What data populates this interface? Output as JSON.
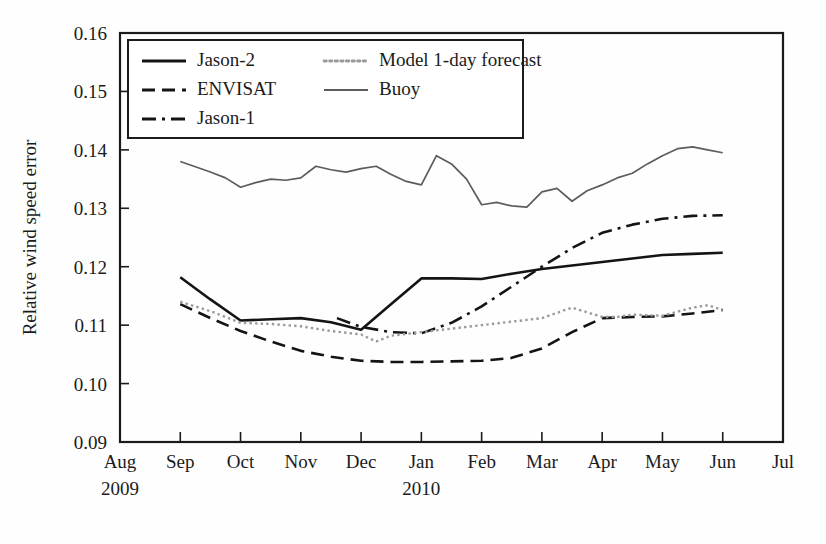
{
  "chart_data": {
    "type": "line",
    "title": "",
    "xlabel": "",
    "ylabel": "Relative wind speed error",
    "ylim": [
      0.09,
      0.16
    ],
    "yticks": [
      "0.09",
      "0.10",
      "0.11",
      "0.12",
      "0.13",
      "0.14",
      "0.15",
      "0.16"
    ],
    "ytick_values": [
      0.09,
      0.1,
      0.11,
      0.12,
      0.13,
      0.14,
      0.15,
      0.16
    ],
    "xticks": [
      "Aug",
      "Sep",
      "Oct",
      "Nov",
      "Dec",
      "Jan",
      "Feb",
      "Mar",
      "Apr",
      "May",
      "Jun",
      "Jul"
    ],
    "xtick_values": [
      0,
      1,
      2,
      3,
      4,
      5,
      6,
      7,
      8,
      9,
      10,
      11
    ],
    "xlim": [
      0,
      11
    ],
    "year_labels": [
      {
        "text": "2009",
        "x": 0
      },
      {
        "text": "2010",
        "x": 5
      }
    ],
    "grid": false,
    "legend_position": "top-left-inside",
    "series": [
      {
        "name": "Jason-2",
        "style": "solid",
        "color": "#141414",
        "width": 2.6,
        "x": [
          1,
          1.5,
          2,
          2.5,
          3,
          3.5,
          4,
          4.5,
          5,
          5.5,
          6,
          6.5,
          7,
          7.5,
          8,
          8.5,
          9,
          9.5,
          10
        ],
        "values": [
          0.1182,
          0.1144,
          0.1108,
          0.111,
          0.1112,
          0.1105,
          0.1092,
          0.1136,
          0.118,
          0.118,
          0.1179,
          0.1188,
          0.1196,
          0.1202,
          0.1208,
          0.1214,
          0.122,
          0.1222,
          0.1224
        ]
      },
      {
        "name": "ENVISAT",
        "style": "dashed",
        "color": "#141414",
        "width": 2.6,
        "x": [
          1,
          1.5,
          2,
          2.5,
          3,
          3.5,
          4,
          4.5,
          5,
          5.5,
          6,
          6.5,
          7,
          7.5,
          8,
          8.5,
          9,
          9.5,
          10
        ],
        "values": [
          0.1136,
          0.1112,
          0.109,
          0.1072,
          0.1056,
          0.1046,
          0.1039,
          0.1037,
          0.1037,
          0.1038,
          0.1039,
          0.1044,
          0.106,
          0.1088,
          0.1112,
          0.1114,
          0.1115,
          0.112,
          0.1126
        ]
      },
      {
        "name": "Jason-1",
        "style": "dashdot",
        "color": "#141414",
        "width": 2.6,
        "x": [
          3.6,
          4,
          4.5,
          5,
          5.5,
          6,
          6.5,
          7,
          7.5,
          8,
          8.5,
          9,
          9.5,
          10
        ],
        "values": [
          0.1112,
          0.1097,
          0.1088,
          0.1086,
          0.1104,
          0.1132,
          0.1166,
          0.12,
          0.1232,
          0.1258,
          0.1272,
          0.1282,
          0.1287,
          0.1288
        ]
      },
      {
        "name": "Model 1-day forecast",
        "style": "dotted",
        "color": "#9a9a9a",
        "width": 2.4,
        "x": [
          1,
          1.5,
          2,
          2.5,
          3,
          3.5,
          4,
          4.25,
          4.5,
          5,
          5.5,
          6,
          6.5,
          7,
          7.5,
          8,
          8.25,
          8.5,
          9,
          9.5,
          9.75,
          10
        ],
        "values": [
          0.114,
          0.1124,
          0.1104,
          0.1102,
          0.1098,
          0.109,
          0.1084,
          0.1072,
          0.1082,
          0.1088,
          0.1094,
          0.11,
          0.1106,
          0.1112,
          0.113,
          0.1114,
          0.1114,
          0.1118,
          0.1116,
          0.113,
          0.1134,
          0.1126
        ]
      },
      {
        "name": "Buoy",
        "style": "solid-thin",
        "color": "#5c5c5c",
        "width": 1.7,
        "x": [
          1,
          1.25,
          1.5,
          1.75,
          2,
          2.25,
          2.5,
          2.75,
          3,
          3.25,
          3.5,
          3.75,
          4,
          4.25,
          4.5,
          4.75,
          5,
          5.25,
          5.5,
          5.75,
          6,
          6.25,
          6.5,
          6.75,
          7,
          7.25,
          7.5,
          7.75,
          8,
          8.25,
          8.5,
          8.75,
          9,
          9.25,
          9.5,
          9.75,
          10
        ],
        "values": [
          0.138,
          0.1371,
          0.1362,
          0.1352,
          0.1336,
          0.1344,
          0.135,
          0.1348,
          0.1352,
          0.1372,
          0.1366,
          0.1362,
          0.1368,
          0.1372,
          0.1358,
          0.1346,
          0.134,
          0.139,
          0.1376,
          0.135,
          0.1306,
          0.131,
          0.1304,
          0.1302,
          0.1328,
          0.1334,
          0.1312,
          0.133,
          0.134,
          0.1352,
          0.136,
          0.1376,
          0.139,
          0.1402,
          0.1405,
          0.14,
          0.1395
        ]
      }
    ],
    "legend": [
      {
        "label": "Jason-2",
        "style": "solid",
        "color": "#141414",
        "col": 0,
        "row": 0
      },
      {
        "label": "Model 1-day forecast",
        "style": "dotted",
        "color": "#9a9a9a",
        "col": 1,
        "row": 0
      },
      {
        "label": "ENVISAT",
        "style": "dashed",
        "color": "#141414",
        "col": 0,
        "row": 1
      },
      {
        "label": "Buoy",
        "style": "solid-thin",
        "color": "#5c5c5c",
        "col": 1,
        "row": 1
      },
      {
        "label": "Jason-1",
        "style": "dashdot",
        "color": "#141414",
        "col": 0,
        "row": 2
      }
    ]
  },
  "colors": {
    "axis": "#1b1b1b",
    "background": "#fefefe",
    "primary": "#141414",
    "buoy": "#5c5c5c",
    "model": "#9a9a9a"
  }
}
